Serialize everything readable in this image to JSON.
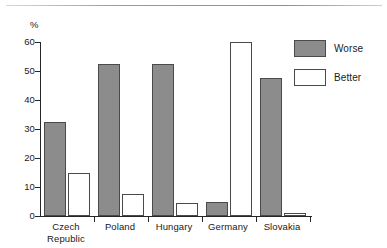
{
  "chart_data": {
    "type": "bar",
    "title": "",
    "subtitle": "",
    "xlabel": "",
    "ylabel": "%",
    "ylim": [
      0,
      60
    ],
    "yticks": [
      0,
      10,
      20,
      30,
      40,
      50,
      60
    ],
    "ytick_labels": [
      "0",
      "10",
      "20",
      "30",
      "40",
      "50",
      "60"
    ],
    "grid": false,
    "legend_position": "right",
    "categories": [
      "Czech\nRepublic",
      "Poland",
      "Hungary",
      "Germany",
      "Slovakia"
    ],
    "series": [
      {
        "name": "Worse",
        "color": "#8c8c8c",
        "values": [
          32.5,
          52.5,
          52.5,
          5,
          47.5
        ]
      },
      {
        "name": "Better",
        "color": "#ffffff",
        "values": [
          15,
          7.5,
          4.5,
          60,
          1
        ]
      }
    ]
  },
  "legend": {
    "items": [
      {
        "label": "Worse"
      },
      {
        "label": "Better"
      }
    ]
  },
  "colors": {
    "worse_fill": "#8c8c8c",
    "better_fill": "#ffffff",
    "outline": "#4a4a4a",
    "axis": "#262626",
    "text": "#1a1a1a"
  }
}
